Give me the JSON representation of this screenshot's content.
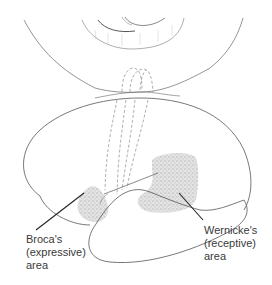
{
  "figure": {
    "labels": {
      "broca": {
        "line1": "Broca's",
        "line2": "(expressive)",
        "line3": "area"
      },
      "wernicke": {
        "line1": "Wernicke's",
        "line2": "(receptive)",
        "line3": "area"
      }
    },
    "colors": {
      "outline": "#555555",
      "shading": "#c8c8c8",
      "pointer": "#222222",
      "text": "#3a3a3a"
    }
  }
}
